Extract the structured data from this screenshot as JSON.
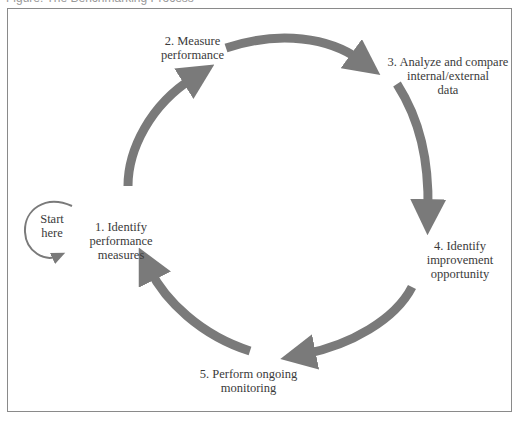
{
  "caption": "Figure: The Benchmarking Process",
  "diagram": {
    "type": "cycle",
    "arrow_color": "#7a7a7a",
    "border_color": "#8a8a8a",
    "start": {
      "line1": "Start",
      "line2": "here"
    },
    "steps": [
      {
        "lines": [
          "1. Identify",
          "performance",
          "measures"
        ]
      },
      {
        "lines": [
          "2. Measure",
          "performance"
        ]
      },
      {
        "lines": [
          "3. Analyze and compare",
          "internal/external",
          "data"
        ]
      },
      {
        "lines": [
          "4. Identify",
          "improvement",
          "opportunity"
        ]
      },
      {
        "lines": [
          "5. Perform ongoing",
          "monitoring"
        ]
      }
    ],
    "edges": [
      {
        "from": 1,
        "to": 2
      },
      {
        "from": 2,
        "to": 3
      },
      {
        "from": 3,
        "to": 4
      },
      {
        "from": 4,
        "to": 5
      },
      {
        "from": 5,
        "to": 1
      }
    ]
  }
}
